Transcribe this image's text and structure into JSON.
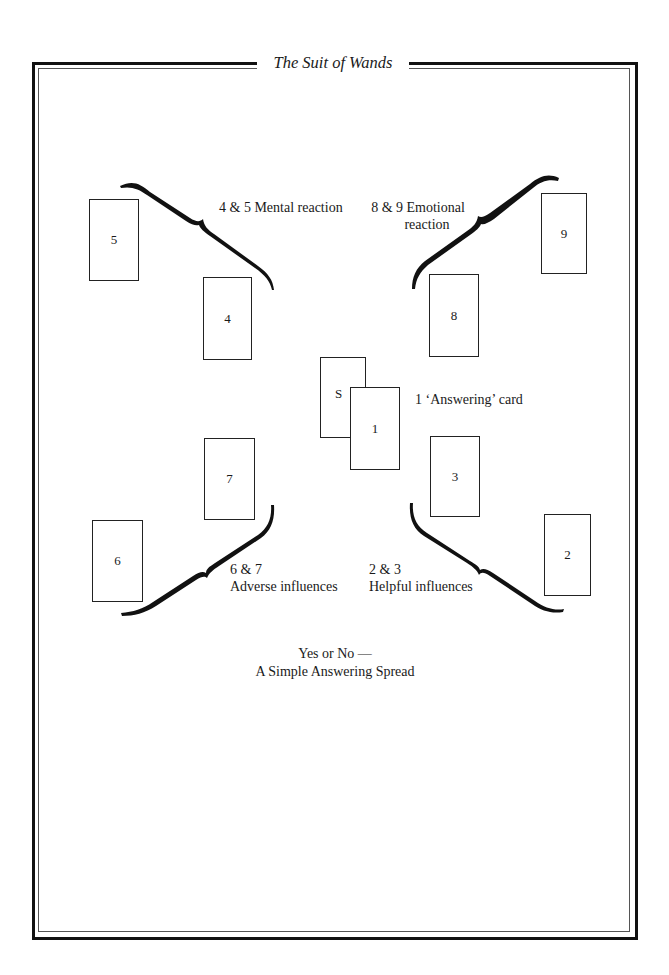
{
  "header": {
    "title": "The Suit of Wands"
  },
  "cards": [
    {
      "id": "5",
      "label": "5"
    },
    {
      "id": "4",
      "label": "4"
    },
    {
      "id": "9",
      "label": "9"
    },
    {
      "id": "8",
      "label": "8"
    },
    {
      "id": "S",
      "label": "S"
    },
    {
      "id": "1",
      "label": "1"
    },
    {
      "id": "7",
      "label": "7"
    },
    {
      "id": "6",
      "label": "6"
    },
    {
      "id": "3",
      "label": "3"
    },
    {
      "id": "2",
      "label": "2"
    }
  ],
  "labels": {
    "mental": "4 & 5 Mental reaction",
    "emotional_line1": "8 & 9 Emotional",
    "emotional_line2": "reaction",
    "answering": "1 ‘Answering’ card",
    "adverse_line1": "6 & 7",
    "adverse_line2": "Adverse influences",
    "helpful_line1": "2 & 3",
    "helpful_line2": "Helpful influences"
  },
  "caption": {
    "line1": "Yes or No —",
    "line2": "A Simple Answering Spread"
  }
}
